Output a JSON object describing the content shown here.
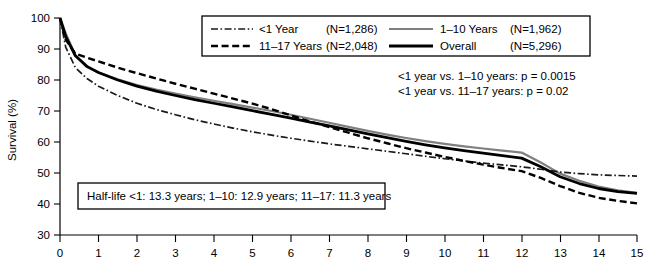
{
  "chart_data": {
    "type": "line",
    "title": "",
    "xlabel": "",
    "ylabel": "Survival (%)",
    "xlim": [
      0,
      15
    ],
    "ylim": [
      30,
      100
    ],
    "xticks": [
      "0",
      "1",
      "2",
      "3",
      "4",
      "5",
      "6",
      "7",
      "8",
      "9",
      "10",
      "11",
      "12",
      "13",
      "14",
      "15"
    ],
    "yticks": [
      "30",
      "40",
      "50",
      "60",
      "70",
      "80",
      "90",
      "100"
    ],
    "grid": false,
    "legend_position": "top-center",
    "x": [
      0,
      0.15,
      0.4,
      0.7,
      1,
      1.5,
      2,
      2.5,
      3,
      3.5,
      4,
      4.5,
      5,
      5.5,
      6,
      6.5,
      7,
      7.5,
      8,
      8.5,
      9,
      9.5,
      10,
      10.5,
      11,
      11.5,
      12,
      12.5,
      13,
      13.5,
      14,
      14.5,
      15
    ],
    "series": [
      {
        "name": "<1 Year",
        "n": "(N=1,286)",
        "n_value": 1286,
        "style": "dash-dot",
        "color": "#1a1a1a",
        "half_life": 13.3,
        "values": [
          100,
          90.5,
          84.0,
          80.5,
          78.0,
          75.0,
          72.5,
          70.5,
          68.8,
          67.2,
          65.8,
          64.5,
          63.3,
          62.2,
          61.2,
          60.3,
          59.4,
          58.6,
          57.8,
          57.0,
          56.2,
          55.4,
          54.6,
          53.9,
          53.2,
          52.6,
          52.0,
          51.2,
          50.3,
          49.8,
          49.4,
          49.2,
          49.0
        ]
      },
      {
        "name": "1-10 Years",
        "n": "(N=1,962)",
        "n_value": 1962,
        "style": "solid-gray",
        "color": "#7f7f7f",
        "half_life": 12.9,
        "values": [
          100,
          95.0,
          88.0,
          84.2,
          82.4,
          80.2,
          78.4,
          76.9,
          75.6,
          74.4,
          73.3,
          72.2,
          71.1,
          70.0,
          68.8,
          67.5,
          66.2,
          64.9,
          63.6,
          62.4,
          61.3,
          60.3,
          59.4,
          58.6,
          57.9,
          57.2,
          56.6,
          53.4,
          49.8,
          47.5,
          45.6,
          44.4,
          43.6
        ]
      },
      {
        "name": "11-17 Years",
        "n": "(N=2,048)",
        "n_value": 2048,
        "style": "dashed",
        "color": "#000000",
        "half_life": 11.3,
        "values": [
          100,
          93.0,
          88.5,
          87.2,
          86.0,
          84.0,
          82.2,
          80.5,
          78.8,
          77.2,
          75.6,
          74.0,
          72.4,
          70.6,
          68.6,
          66.6,
          64.8,
          63.0,
          61.2,
          59.6,
          58.0,
          56.6,
          55.2,
          53.9,
          52.7,
          51.6,
          50.6,
          48.4,
          45.8,
          43.6,
          42.0,
          41.0,
          40.2
        ]
      },
      {
        "name": "Overall",
        "n": "(N=5,296)",
        "n_value": 5296,
        "style": "solid-black",
        "color": "#000000",
        "half_life": 12.9,
        "values": [
          100,
          94.0,
          87.8,
          84.4,
          82.4,
          80.0,
          78.0,
          76.4,
          75.0,
          73.7,
          72.5,
          71.3,
          70.1,
          68.9,
          67.7,
          66.4,
          65.2,
          63.9,
          62.6,
          61.4,
          60.2,
          59.1,
          58.1,
          57.2,
          56.4,
          55.6,
          54.8,
          52.0,
          48.8,
          46.6,
          45.0,
          44.0,
          43.4
        ]
      }
    ],
    "annotations": [
      "<1 year vs. 1–10 years: p = 0.0015",
      "<1 year vs. 11–17 years: p = 0.02",
      "Half-life <1: 13.3 years; 1–10: 12.9 years; 11–17: 11.3 years"
    ]
  },
  "axes": {
    "y_title": "Survival (%)",
    "y_ticks": [
      "100",
      "90",
      "80",
      "70",
      "60",
      "50",
      "40",
      "30"
    ],
    "x_ticks": [
      "0",
      "1",
      "2",
      "3",
      "4",
      "5",
      "6",
      "7",
      "8",
      "9",
      "10",
      "11",
      "12",
      "13",
      "14",
      "15"
    ]
  },
  "legend": {
    "entries": [
      {
        "label": "<1 Year",
        "count": "(N=1,286)"
      },
      {
        "label": "1–10 Years",
        "count": "(N=1,962)"
      },
      {
        "label": "11–17 Years",
        "count": "(N=2,048)"
      },
      {
        "label": "Overall",
        "count": "(N=5,296)"
      }
    ]
  },
  "pvalues": {
    "line1": "<1 year vs. 1–10 years: p = 0.0015",
    "line2": "<1 year vs. 11–17 years: p = 0.02"
  },
  "halflife": {
    "text": "Half-life <1: 13.3 years; 1–10: 12.9 years; 11–17: 11.3 years"
  },
  "colors": {
    "gray_series": "#7f7f7f",
    "black_series": "#000000",
    "background": "#ffffff"
  }
}
